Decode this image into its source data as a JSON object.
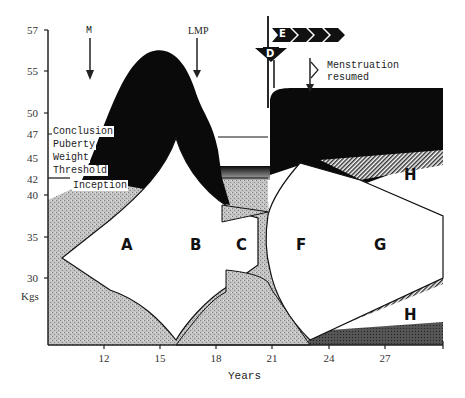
{
  "diagram": {
    "y_axis": {
      "unit_label": "Kgs",
      "ticks": [
        "57",
        "55",
        "50",
        "47",
        "45",
        "42",
        "40",
        "35",
        "30"
      ]
    },
    "x_axis": {
      "title": "Years",
      "ticks": [
        "12",
        "15",
        "18",
        "21",
        "24",
        "27"
      ]
    },
    "annotations": {
      "m": "M",
      "lmp": "LMP",
      "menstruation_line1": "Menstruation",
      "menstruation_line2": "resumed",
      "conclusion": "Conclusion",
      "puberty": "Puberty",
      "weight": "Weight",
      "threshold": "Threshold",
      "inception": "Inception",
      "d_marker": "D",
      "e_marker": "E"
    },
    "regions": {
      "a": "A",
      "b": "B",
      "c": "C",
      "f": "F",
      "g": "G",
      "h_upper": "H",
      "h_lower": "H"
    },
    "colors": {
      "black": "#0a0a0a",
      "stipple": "#b8b8b8",
      "ink": "#222222"
    }
  }
}
